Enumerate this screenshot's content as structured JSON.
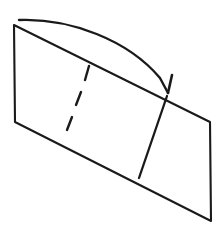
{
  "figure": {
    "background_color": "#ffffff",
    "stroke_color": "#1a1a1a",
    "canvas": {
      "width": 219,
      "height": 229
    },
    "elements": {
      "sheet": {
        "name": "paper-sheet",
        "shape": "parallelogram",
        "points": "14,25 210,122 211,221 15,122",
        "corners": {
          "top_left": [
            14,
            25
          ],
          "top_right": [
            210,
            122
          ],
          "bottom_right": [
            211,
            221
          ],
          "bottom_left": [
            15,
            122
          ]
        }
      },
      "dashed_fold_line": {
        "name": "dashed-fold-line",
        "style": "dashed",
        "segments": [
          {
            "x1": 89,
            "y1": 66,
            "x2": 85,
            "y2": 80
          },
          {
            "x1": 81,
            "y1": 92,
            "x2": 76,
            "y2": 105
          },
          {
            "x1": 72,
            "y1": 117,
            "x2": 67,
            "y2": 130
          }
        ]
      },
      "solid_crease_line": {
        "name": "solid-crease-line",
        "style": "solid",
        "x1": 167,
        "y1": 96,
        "x2": 139,
        "y2": 178
      },
      "motion_arrow": {
        "name": "fold-motion-arrow",
        "arc_path": "M 19,20 C 70,18 128,40 160,78 L 168,93",
        "arrow_tip": [
          168,
          93
        ],
        "barb_path": "M 172,75 L 168,93",
        "direction": "left-to-right-curving-down"
      }
    }
  }
}
